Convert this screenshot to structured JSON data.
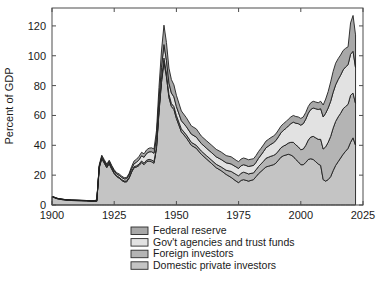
{
  "chart_data": {
    "type": "area",
    "stacked": true,
    "title": "",
    "xlabel": "",
    "ylabel": "Percent of GDP",
    "xlim": [
      1900,
      2025
    ],
    "ylim": [
      0,
      132
    ],
    "xticks": [
      1900,
      1925,
      1950,
      1975,
      2000,
      2025
    ],
    "xtick_labels": [
      "1900",
      "1925",
      "1950",
      "1975",
      "2000",
      "2025"
    ],
    "yticks": [
      0,
      20,
      40,
      60,
      80,
      100,
      120
    ],
    "ytick_labels": [
      "0",
      "20",
      "40",
      "60",
      "80",
      "100",
      "120"
    ],
    "grid": false,
    "legend_position": "below-center",
    "legend_order_top_to_bottom": [
      "Federal reserve",
      "Gov't agencies and trust funds",
      "Foreign investors",
      "Domestic private investors"
    ],
    "colors": {
      "federal_reserve": "#a8a8a8",
      "gov_agencies_and_trust_funds": "#e2e2e2",
      "foreign_investors": "#b4b4b4",
      "domestic_private_investors": "#c4c4c4",
      "outline": "#1f1f1f",
      "axis": "#4d4d4d",
      "background": "#ffffff"
    },
    "x": [
      1900,
      1902,
      1904,
      1906,
      1908,
      1910,
      1912,
      1914,
      1916,
      1917,
      1918,
      1919,
      1920,
      1921,
      1922,
      1923,
      1924,
      1925,
      1926,
      1927,
      1928,
      1929,
      1930,
      1931,
      1932,
      1933,
      1934,
      1935,
      1936,
      1937,
      1938,
      1939,
      1940,
      1941,
      1942,
      1943,
      1944,
      1945,
      1946,
      1947,
      1948,
      1949,
      1950,
      1952,
      1954,
      1956,
      1958,
      1960,
      1962,
      1964,
      1966,
      1968,
      1970,
      1972,
      1974,
      1975,
      1976,
      1977,
      1978,
      1979,
      1980,
      1981,
      1982,
      1983,
      1984,
      1985,
      1986,
      1987,
      1988,
      1989,
      1990,
      1991,
      1992,
      1993,
      1994,
      1995,
      1996,
      1997,
      1998,
      1999,
      2000,
      2001,
      2002,
      2003,
      2004,
      2005,
      2006,
      2007,
      2008,
      2009,
      2010,
      2011,
      2012,
      2013,
      2014,
      2015,
      2016,
      2017,
      2018,
      2019,
      2020,
      2021,
      2022
    ],
    "series": [
      {
        "name": "Domestic private investors",
        "values": [
          5.5,
          4.2,
          3.6,
          3.2,
          3.0,
          2.9,
          2.8,
          2.7,
          2.5,
          2.4,
          2.4,
          25.0,
          31.0,
          28.0,
          25.0,
          27.5,
          24.0,
          21.0,
          19.0,
          18.0,
          16.5,
          15.5,
          15.5,
          18.0,
          22.0,
          25.0,
          25.5,
          26.5,
          28.5,
          27.0,
          29.0,
          29.5,
          29.0,
          28.0,
          38.0,
          62.0,
          82.0,
          96.0,
          86.0,
          72.0,
          66.0,
          64.0,
          58.0,
          49.0,
          45.0,
          40.0,
          38.0,
          34.0,
          31.0,
          28.0,
          25.0,
          23.0,
          20.5,
          18.5,
          16.0,
          15.0,
          16.5,
          17.0,
          16.5,
          16.0,
          16.5,
          17.0,
          19.0,
          21.0,
          22.5,
          24.0,
          25.5,
          26.0,
          26.5,
          27.0,
          28.0,
          30.0,
          32.0,
          33.0,
          33.5,
          34.0,
          33.5,
          32.5,
          30.5,
          29.0,
          27.0,
          27.0,
          28.5,
          30.5,
          31.0,
          30.5,
          29.0,
          27.5,
          26.5,
          17.0,
          16.0,
          17.0,
          19.0,
          23.0,
          26.5,
          29.0,
          31.5,
          34.0,
          36.0,
          38.0,
          42.0,
          45.0,
          40.0
        ]
      },
      {
        "name": "Foreign investors",
        "values": [
          0.2,
          0.2,
          0.2,
          0.2,
          0.2,
          0.2,
          0.2,
          0.2,
          0.2,
          0.3,
          0.4,
          0.6,
          0.8,
          0.8,
          0.8,
          0.8,
          0.7,
          0.7,
          0.6,
          0.6,
          0.6,
          0.6,
          0.6,
          0.6,
          0.6,
          0.7,
          0.8,
          0.9,
          1.0,
          1.0,
          1.0,
          1.1,
          1.2,
          1.2,
          1.4,
          1.8,
          2.2,
          2.5,
          2.4,
          2.2,
          2.0,
          2.0,
          2.0,
          2.0,
          2.0,
          2.0,
          2.0,
          2.2,
          2.2,
          2.3,
          2.3,
          2.5,
          2.8,
          4.0,
          4.5,
          4.5,
          4.8,
          5.0,
          5.0,
          4.8,
          4.7,
          4.5,
          4.6,
          4.8,
          5.0,
          5.3,
          5.8,
          6.0,
          6.2,
          6.2,
          6.2,
          6.2,
          6.3,
          6.5,
          6.8,
          7.5,
          8.5,
          9.5,
          9.8,
          10.0,
          10.0,
          10.5,
          11.5,
          13.0,
          14.5,
          15.5,
          16.0,
          16.5,
          17.5,
          20.5,
          23.0,
          25.0,
          27.0,
          28.5,
          29.5,
          30.0,
          30.0,
          30.5,
          30.0,
          29.5,
          31.5,
          30.0,
          28.0
        ]
      },
      {
        "name": "Gov't agencies and trust funds",
        "values": [
          0.1,
          0.1,
          0.1,
          0.1,
          0.1,
          0.1,
          0.1,
          0.1,
          0.1,
          0.2,
          0.3,
          0.5,
          0.6,
          0.7,
          0.8,
          0.9,
          1.0,
          1.1,
          1.2,
          1.3,
          1.4,
          1.4,
          1.5,
          1.6,
          1.8,
          2.0,
          2.4,
          3.0,
          3.5,
          4.0,
          4.5,
          5.0,
          5.5,
          5.5,
          6.0,
          7.0,
          8.0,
          9.0,
          8.5,
          7.5,
          7.0,
          6.5,
          6.0,
          5.5,
          5.5,
          5.5,
          5.5,
          5.0,
          5.0,
          5.0,
          5.0,
          5.0,
          5.0,
          5.0,
          5.0,
          5.0,
          5.0,
          5.0,
          5.0,
          5.0,
          5.0,
          5.0,
          5.0,
          5.5,
          6.0,
          6.5,
          7.0,
          7.5,
          8.0,
          8.5,
          9.0,
          9.5,
          10.0,
          10.5,
          11.0,
          11.5,
          12.5,
          13.5,
          14.5,
          15.5,
          16.5,
          17.0,
          17.5,
          18.0,
          18.5,
          19.0,
          19.5,
          20.0,
          20.5,
          21.5,
          22.5,
          23.0,
          23.5,
          24.0,
          24.5,
          25.0,
          25.5,
          26.0,
          26.5,
          26.5,
          27.5,
          28.0,
          24.0
        ]
      },
      {
        "name": "Federal reserve",
        "values": [
          0.0,
          0.0,
          0.0,
          0.0,
          0.0,
          0.0,
          0.0,
          0.0,
          0.0,
          0.1,
          0.3,
          0.8,
          1.0,
          0.9,
          0.8,
          0.8,
          0.8,
          0.8,
          0.8,
          0.9,
          0.9,
          0.8,
          0.8,
          1.0,
          1.4,
          1.8,
          2.0,
          2.2,
          2.3,
          2.3,
          2.4,
          2.5,
          2.6,
          2.8,
          4.5,
          8.0,
          11.0,
          13.0,
          12.0,
          10.0,
          9.0,
          8.0,
          7.5,
          6.5,
          6.0,
          5.5,
          5.5,
          5.0,
          5.0,
          5.0,
          5.0,
          5.0,
          4.8,
          4.8,
          4.5,
          4.5,
          4.5,
          4.5,
          4.5,
          4.5,
          4.5,
          4.5,
          4.5,
          4.5,
          4.5,
          4.5,
          4.5,
          4.5,
          4.5,
          4.5,
          4.5,
          4.5,
          4.5,
          4.5,
          4.5,
          4.5,
          4.5,
          4.5,
          4.5,
          4.5,
          4.5,
          4.5,
          4.5,
          4.5,
          4.5,
          4.5,
          4.5,
          4.5,
          5.0,
          8.0,
          9.5,
          11.0,
          13.0,
          14.0,
          14.5,
          14.0,
          13.5,
          13.0,
          12.5,
          12.0,
          21.0,
          24.0,
          22.0
        ]
      }
    ]
  },
  "axis": {
    "ylabel": "Percent of GDP"
  },
  "legend": {
    "items": [
      {
        "label": "Federal reserve",
        "color": "#a8a8a8"
      },
      {
        "label": "Gov't agencies and trust funds",
        "color": "#e2e2e2"
      },
      {
        "label": "Foreign investors",
        "color": "#b4b4b4"
      },
      {
        "label": "Domestic private investors",
        "color": "#c4c4c4"
      }
    ]
  }
}
